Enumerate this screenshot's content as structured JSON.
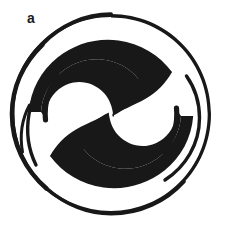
{
  "figure": {
    "panel_label": "a",
    "caption": "",
    "background_color": "#ffffff",
    "ink_color": "#181818",
    "canvas": {
      "width": 226,
      "height": 235
    },
    "elements": {
      "outer_circle": {
        "name": "outer-circle",
        "center": [
          111,
          114
        ],
        "radius": 100,
        "stroke_color": "#181818",
        "stroke_min_width": 2.6,
        "stroke_max_width": 6.4,
        "thickest_at": "upper-left",
        "thinnest_at": "upper-right"
      },
      "upper_crescent": {
        "name": "upper-left-crescent",
        "fill_color": "#181818",
        "tip": [
          138,
          78
        ],
        "tail_merges_with_circle_at": "left",
        "orientation": "bulges from upper-left toward center-right"
      },
      "lower_crescent": {
        "name": "lower-right-crescent",
        "fill_color": "#181818",
        "tip": [
          97,
          152
        ],
        "tail_merges_with_circle_at": "right",
        "orientation": "bulges from lower-right toward center-left"
      },
      "pinch_point": {
        "name": "central-pinch-point",
        "position": [
          113,
          115
        ]
      },
      "inner_spiral_left": {
        "name": "inner-spiral-arc-left",
        "stroke_color": "#181818",
        "stroke_width": 3.2
      },
      "inner_spiral_right": {
        "name": "inner-spiral-arc-right",
        "stroke_color": "#181818",
        "stroke_width": 3.2
      }
    }
  }
}
